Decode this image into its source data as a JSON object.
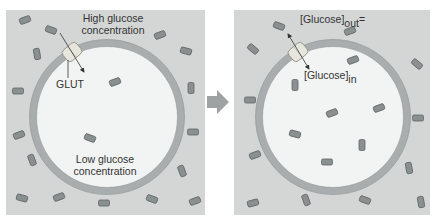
{
  "figure": {
    "colors": {
      "extracellular": "#d4d6d6",
      "cytoplasm": "#f2f3f3",
      "membrane": "#a9adad",
      "membrane_edge": "#8d9292",
      "glucose_fill": "#8a8f8f",
      "glucose_edge": "#5f6464",
      "glut_fill": "#e6e6dc",
      "arrow": "#333333",
      "transition_arrow": "#9ea2a2"
    },
    "left_panel": {
      "label_outside_line1": "High glucose",
      "label_outside_line2": "concentration",
      "label_transporter": "GLUT",
      "label_inside_line1": "Low glucose",
      "label_inside_line2": "concentration",
      "glucose_outside_count": 17,
      "glucose_inside_count": 2
    },
    "right_panel": {
      "label_out_bracket": "[Glucose]",
      "label_out_sub": "out",
      "label_equals": "=",
      "label_in_bracket": "[Glucose]",
      "label_in_sub": "in",
      "glucose_outside_count": 13,
      "glucose_inside_count": 6
    },
    "transition_arrow": "right-arrow-icon"
  }
}
